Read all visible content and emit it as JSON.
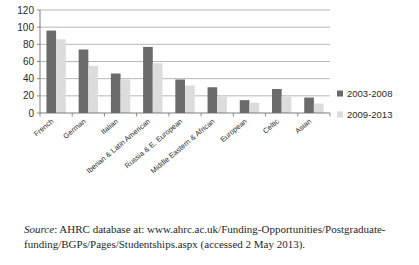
{
  "chart_data": {
    "type": "bar",
    "title": "",
    "xlabel": "",
    "ylabel": "",
    "ylim": [
      0,
      120
    ],
    "yticks": [
      0,
      20,
      40,
      60,
      80,
      100,
      120
    ],
    "grid": true,
    "legend_position": "right",
    "categories": [
      "French",
      "German",
      "Italian",
      "Iberian & Latin American",
      "Russia & E. European",
      "Middle Eastern & African",
      "European",
      "Celtic",
      "Asian"
    ],
    "series": [
      {
        "name": "2003-2008",
        "color": "#6b6b6b",
        "values": [
          96,
          74,
          46,
          77,
          39,
          30,
          15,
          28,
          18
        ]
      },
      {
        "name": "2009-2013",
        "color": "#dcdcdc",
        "values": [
          86,
          55,
          39,
          58,
          32,
          19,
          12,
          19,
          11
        ]
      }
    ]
  },
  "legend": {
    "items": [
      {
        "label": "2003-2008",
        "color": "#6b6b6b"
      },
      {
        "label": "2009-2013",
        "color": "#dcdcdc"
      }
    ]
  },
  "source": {
    "prefix": "Source",
    "text": ": AHRC database at: www.ahrc.ac.uk/Funding-Opportunities/Postgraduate-funding/BGPs/Pages/Studentships.aspx (accessed 2 May 2013)."
  }
}
